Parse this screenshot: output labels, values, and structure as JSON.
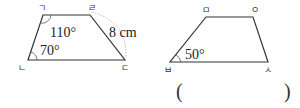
{
  "figure1": {
    "vertices": {
      "top_left": "ㄱ",
      "top_right": "ㄹ",
      "bottom_right": "ㄷ",
      "bottom_left": "ㄴ"
    },
    "angle_top_left": "110°",
    "angle_bottom_left": "70°",
    "side_length": "8 cm"
  },
  "figure2": {
    "vertices": {
      "top_left": "ㅁ",
      "top_right": "ㅇ",
      "bottom_right": "ㅅ",
      "bottom_left": "ㅂ"
    },
    "angle_bottom_left": "50°"
  },
  "answer": {
    "open_paren": "(",
    "close_paren": ")",
    "value": ""
  },
  "colors": {
    "line": "#333333",
    "dotted": "#aaaaaa"
  }
}
